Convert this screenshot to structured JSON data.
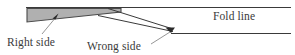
{
  "diagram": {
    "background_color": "#ffffff",
    "line_color": "#3a3a3a",
    "fabric_fill_color": "#b0b0b0",
    "fabric_stroke_color": "#4a4a4a",
    "text_color": "#3a3a3a",
    "labels": {
      "fold_line": "Fold line",
      "right_side": "Right side",
      "wrong_side": "Wrong side"
    },
    "geometry": {
      "top_edge_line": {
        "x1": 26,
        "y1": 7,
        "x2": 291,
        "y2": 7
      },
      "bottom_edge_line": {
        "x1": 171,
        "y1": 33,
        "x2": 291,
        "y2": 33
      },
      "fabric_wedge_points": "27,8 121,8 121,12 27,22",
      "fold_taper_upper": {
        "x1": 109,
        "y1": 9,
        "x2": 172,
        "y2": 29
      },
      "fold_taper_lower": {
        "x1": 100,
        "y1": 15,
        "x2": 172,
        "y2": 31
      },
      "right_side_leader": {
        "x1": 43,
        "y1": 33,
        "x2": 57,
        "y2": 16
      },
      "wrong_side_leader": {
        "x1": 152,
        "y1": 44,
        "x2": 171,
        "y2": 32
      },
      "arrow_right_side": {
        "x": 57,
        "y": 15,
        "direction": "up-right"
      },
      "arrow_wrong_side": {
        "x": 172,
        "y": 30,
        "direction": "down-right"
      }
    }
  }
}
